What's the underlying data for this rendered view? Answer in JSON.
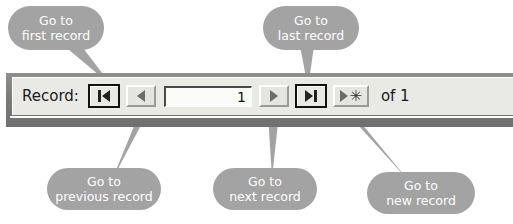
{
  "navbar": {
    "record_label": "Record:",
    "record_value": "1",
    "of_text": "of  1",
    "buttons": [
      {
        "name": "first-record",
        "icon": "first-record-icon"
      },
      {
        "name": "previous-record",
        "icon": "previous-record-icon"
      },
      {
        "name": "next-record",
        "icon": "next-record-icon"
      },
      {
        "name": "last-record",
        "icon": "last-record-icon"
      },
      {
        "name": "new-record",
        "icon": "new-record-icon"
      }
    ],
    "new_record_glyph": "✳"
  },
  "callouts": {
    "first": {
      "line1": "Go to",
      "line2": "first record"
    },
    "last": {
      "line1": "Go to",
      "line2": "last record"
    },
    "previous": {
      "line1": "Go to",
      "line2": "previous record"
    },
    "next": {
      "line1": "Go to",
      "line2": "next record"
    },
    "new": {
      "line1": "Go to",
      "line2": "new record"
    }
  },
  "colors": {
    "callout_fill": "#a3a3a3",
    "callout_text": "#ffffff",
    "bar_face": "#e9e9e6",
    "bar_frame": "#7d7d7d"
  }
}
